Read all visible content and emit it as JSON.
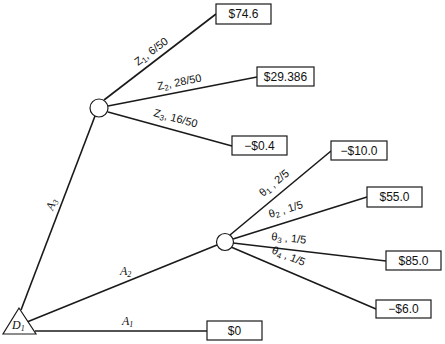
{
  "diagram": {
    "type": "decision-tree",
    "decision_node": {
      "label": "D",
      "subscript": "1"
    },
    "actions": [
      {
        "id": "A1",
        "label": "A",
        "subscript": "1",
        "payoff": "$0"
      },
      {
        "id": "A2",
        "label": "A",
        "subscript": "2"
      },
      {
        "id": "A3",
        "label": "A",
        "subscript": "3"
      }
    ],
    "chance_nodes": [
      {
        "id": "after-A3",
        "branches": [
          {
            "symbol": "Z",
            "subscript": "1",
            "probability": "6/50",
            "payoff": "$74.6"
          },
          {
            "symbol": "Z",
            "subscript": "2",
            "probability": "28/50",
            "payoff": "$29.386"
          },
          {
            "symbol": "Z",
            "subscript": "3",
            "probability": "16/50",
            "payoff": "−$0.4"
          }
        ]
      },
      {
        "id": "after-A2",
        "branches": [
          {
            "symbol": "θ",
            "subscript": "1",
            "probability": "2/5",
            "payoff": "−$10.0"
          },
          {
            "symbol": "θ",
            "subscript": "2",
            "probability": "1/5",
            "payoff": "$55.0"
          },
          {
            "symbol": "θ",
            "subscript": "3",
            "probability": "1/5",
            "payoff": "$85.0"
          },
          {
            "symbol": "θ",
            "subscript": "4",
            "probability": "1/5",
            "payoff": "−$6.0"
          }
        ]
      }
    ]
  }
}
